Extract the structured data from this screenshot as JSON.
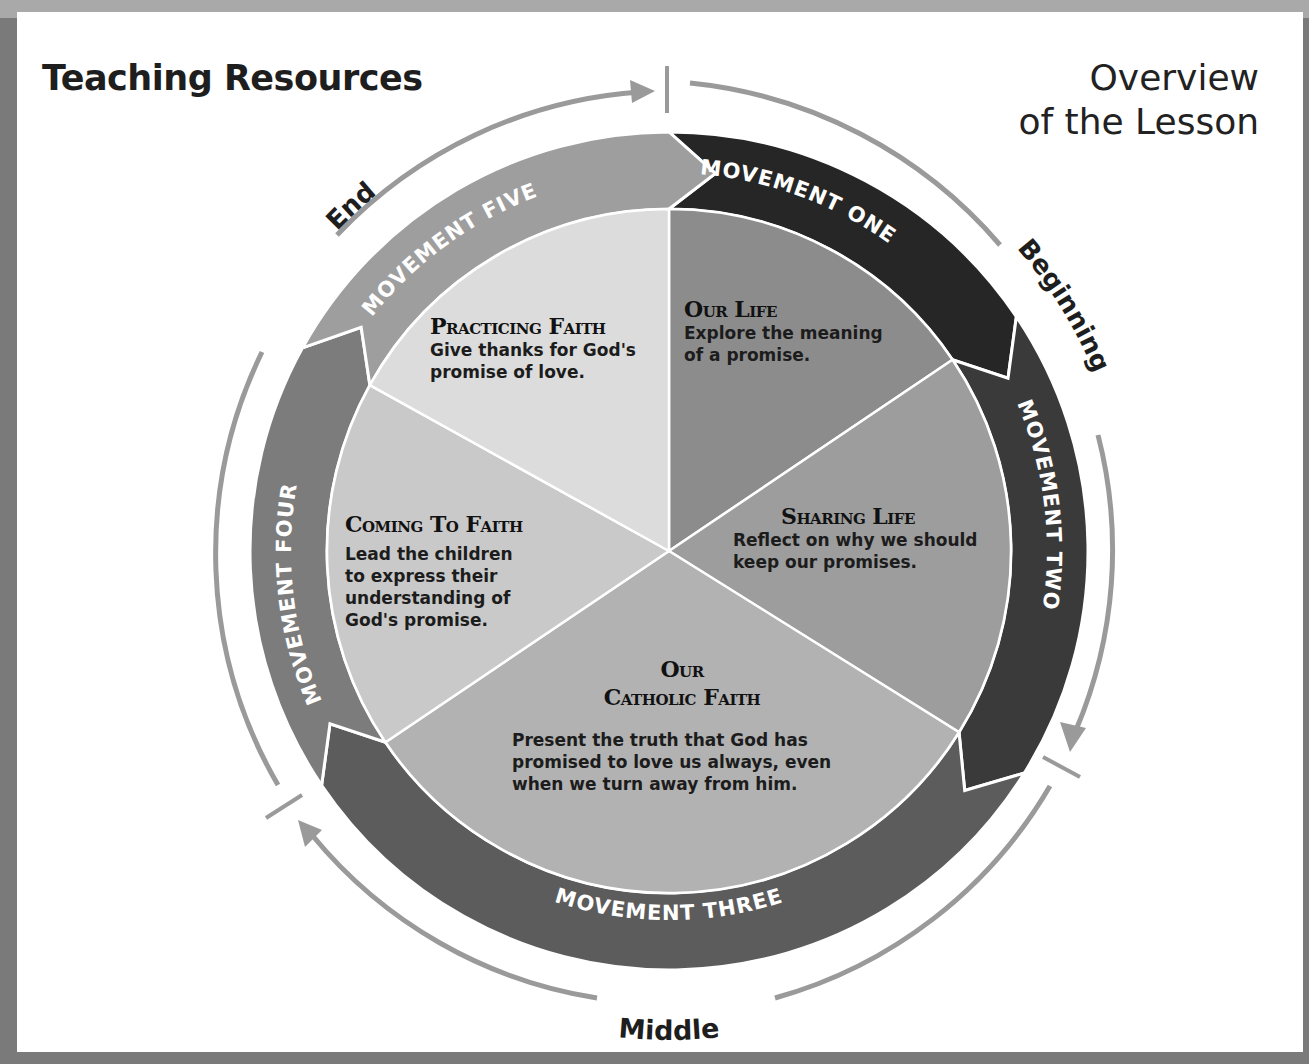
{
  "header": {
    "left_title": "Teaching Resources",
    "right_title_line1": "Overview",
    "right_title_line2": "of the Lesson"
  },
  "phases": {
    "beginning": "Beginning",
    "middle": "Middle",
    "end": "End"
  },
  "movements": [
    {
      "ring_label": "MOVEMENT ONE",
      "heading": "Our Life",
      "body_lines": [
        "Explore the meaning",
        "of a promise."
      ],
      "ring_color": "#262626",
      "segment_color": "#8c8c8c"
    },
    {
      "ring_label": "MOVEMENT TWO",
      "heading": "Sharing Life",
      "body_lines": [
        "Reflect on why we should",
        "keep our promises."
      ],
      "ring_color": "#3a3a3a",
      "segment_color": "#9d9d9d"
    },
    {
      "ring_label": "MOVEMENT THREE",
      "heading_line1": "Our",
      "heading_line2": "Catholic Faith",
      "body_lines": [
        "Present the truth that God has",
        "promised to love us always, even",
        "when we turn away from him."
      ],
      "ring_color": "#5c5c5c",
      "segment_color": "#b2b2b2"
    },
    {
      "ring_label": "MOVEMENT FOUR",
      "heading": "Coming To Faith",
      "body_lines": [
        "Lead the children",
        "to express their",
        "understanding of",
        "God's promise."
      ],
      "ring_color": "#7c7c7c",
      "segment_color": "#c9c9c9"
    },
    {
      "ring_label": "MOVEMENT FIVE",
      "heading": "Practicing Faith",
      "body_lines": [
        "Give thanks for God's",
        "promise of love."
      ],
      "ring_color": "#9e9e9e",
      "segment_color": "#dcdcdc"
    }
  ],
  "colors": {
    "arrow_gray": "#9a9a9a",
    "page_bg": "#ffffff",
    "frame": "#7a7a7a"
  }
}
